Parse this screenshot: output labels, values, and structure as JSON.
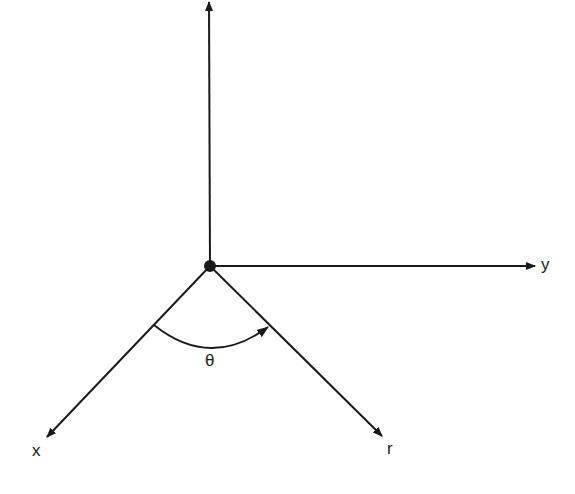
{
  "diagram": {
    "type": "coordinate-axes",
    "colors": {
      "background": "#ffffff",
      "stroke": "#1a1a1a"
    },
    "origin": {
      "x": 210,
      "y": 266
    },
    "axes": [
      {
        "id": "z",
        "label": "",
        "tip": {
          "x": 209,
          "y": 1
        }
      },
      {
        "id": "y",
        "label": "y",
        "tip": {
          "x": 535,
          "y": 266
        }
      },
      {
        "id": "x",
        "label": "x",
        "tip": {
          "x": 47,
          "y": 437
        }
      },
      {
        "id": "r",
        "label": "r",
        "tip": {
          "x": 382,
          "y": 436
        }
      }
    ],
    "angle": {
      "label": "θ",
      "from_axis": "x",
      "to_axis": "r",
      "direction": "counter-clockwise arrow from x toward r"
    }
  }
}
